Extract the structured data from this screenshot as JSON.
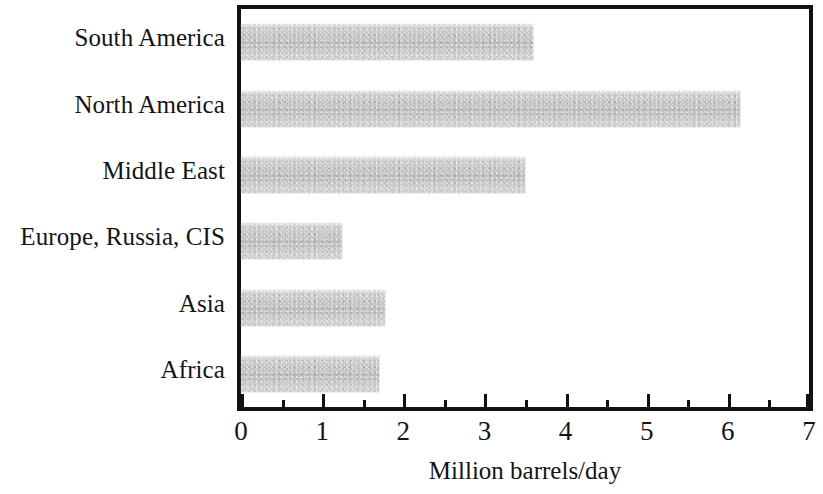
{
  "chart_data": {
    "type": "bar",
    "orientation": "horizontal",
    "title": "",
    "xlabel": "Million barrels/day",
    "ylabel": "",
    "categories": [
      "Africa",
      "Asia",
      "Europe, Russia, CIS",
      "Middle East",
      "North America",
      "South America"
    ],
    "values": [
      1.7,
      1.78,
      1.25,
      3.5,
      6.15,
      3.6
    ],
    "category_order_top_to_bottom": [
      "South America",
      "North America",
      "Middle East",
      "Europe, Russia, CIS",
      "Asia",
      "Africa"
    ],
    "values_top_to_bottom": [
      3.6,
      6.15,
      3.5,
      1.25,
      1.78,
      1.7
    ],
    "xlim": [
      0,
      7
    ],
    "xticks": [
      0,
      1,
      2,
      3,
      4,
      5,
      6,
      7
    ],
    "xtick_labels": [
      "0",
      "1",
      "2",
      "3",
      "4",
      "5",
      "6",
      "7"
    ],
    "minor_tick_interval": 0.5,
    "grid": false,
    "legend": null,
    "bar_color": "#c9c9c9",
    "frame_color": "#111111",
    "text_color": "#141414"
  },
  "axis": {
    "x_title": "Million barrels/day"
  }
}
